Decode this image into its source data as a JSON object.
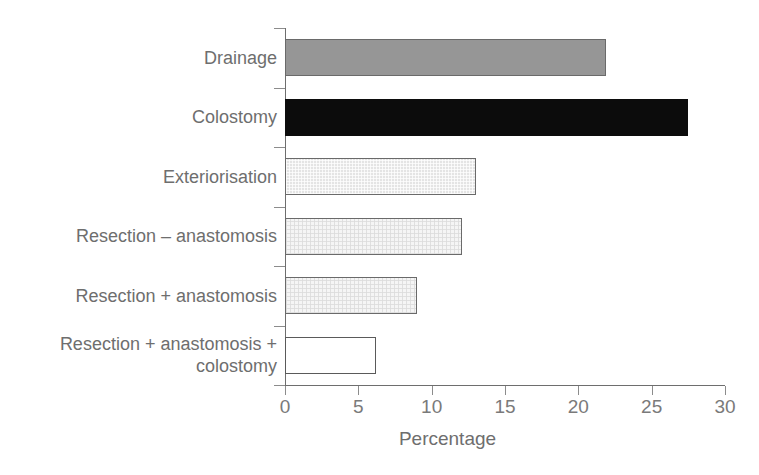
{
  "chart_data": {
    "type": "bar",
    "orientation": "horizontal",
    "title": "",
    "xlabel": "Percentage",
    "ylabel": "",
    "xlim": [
      0,
      30
    ],
    "xticks": [
      0,
      5,
      10,
      15,
      20,
      25,
      30
    ],
    "xticklabels": [
      "0",
      "5",
      "10",
      "15",
      "20",
      "25",
      "30"
    ],
    "grid": false,
    "legend": null,
    "categories": [
      "Drainage",
      "Colostomy",
      "Exteriorisation",
      "Resection – anastomosis",
      "Resection + anastomosis",
      "Resection + anastomosis +\ncolostomy"
    ],
    "values": [
      21.9,
      27.5,
      13.0,
      12.1,
      9.0,
      6.2
    ],
    "bar_styles": [
      "mid-gray",
      "solid-dark",
      "light-hatch",
      "faint-hatch",
      "faint-hatch",
      "plain-white"
    ],
    "bar_colors": [
      "#969696",
      "#0c0c0c",
      "#e4e4e4",
      "#f5f5f5",
      "#f5f5f5",
      "#ffffff"
    ]
  },
  "axis": {
    "title_label": "Percentage",
    "line_color": "#6e6e6e",
    "tick_color": "#8c8c8c",
    "text_color": "#6e6e6e"
  }
}
